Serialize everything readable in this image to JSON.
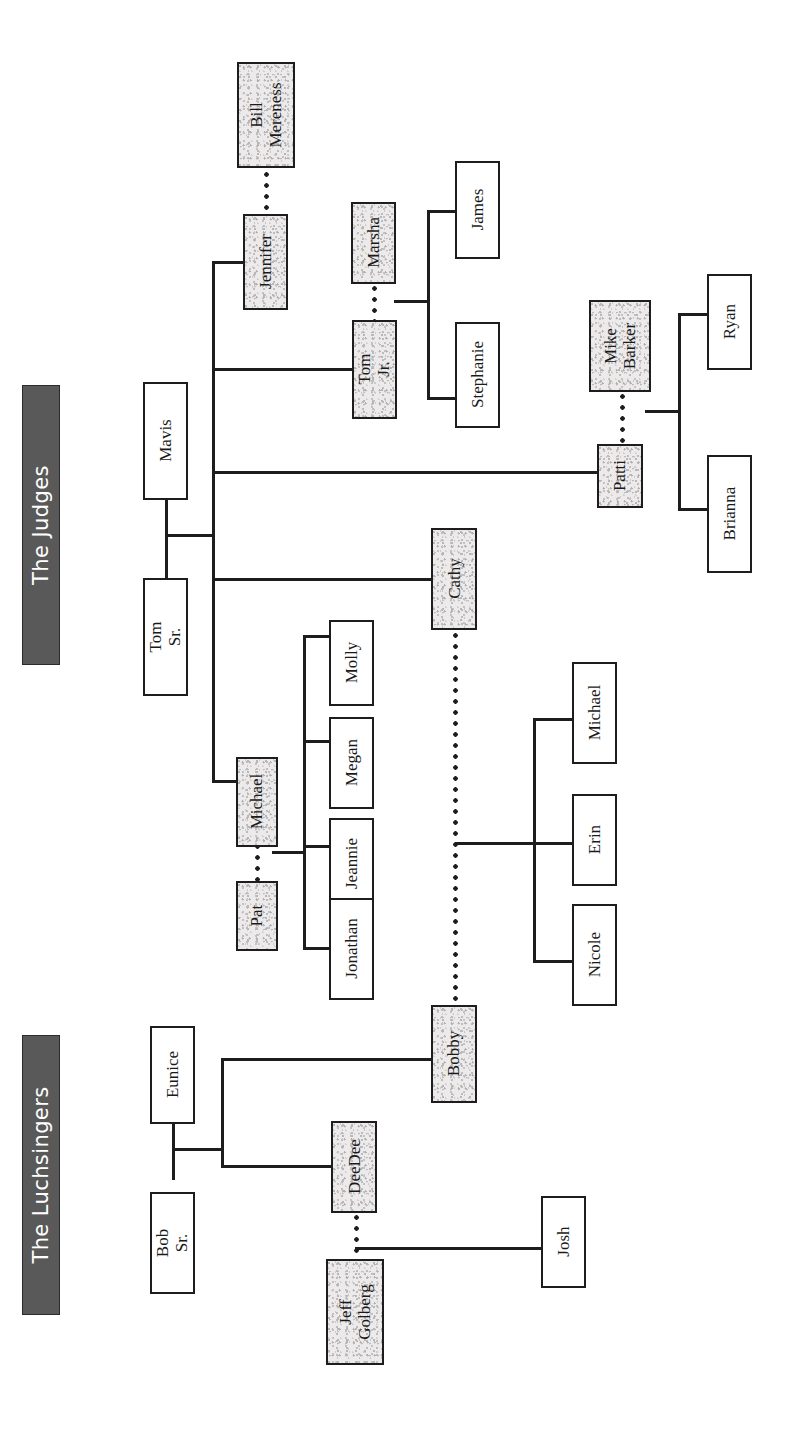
{
  "diagram": {
    "type": "family-tree",
    "width": 793,
    "height": 1439,
    "colors": {
      "banner_fill": "#595959",
      "banner_text": "#ffffff",
      "line": "#1d1d1d",
      "box_border": "#1d1d1d",
      "box_plain_fill": "#ffffff",
      "box_shaded_fill": "#eceaea"
    }
  },
  "banners": [
    {
      "id": "judges",
      "label": "The Judges"
    },
    {
      "id": "luchsingers",
      "label": "The Luchsingers"
    }
  ],
  "people": [
    {
      "id": "bill_mereness",
      "label": "Bill\nMereness",
      "style": "shaded"
    },
    {
      "id": "jennifer",
      "label": "Jennifer",
      "style": "shaded"
    },
    {
      "id": "marsha",
      "label": "Marsha",
      "style": "shaded"
    },
    {
      "id": "james",
      "label": "James",
      "style": "plain"
    },
    {
      "id": "tom_jr",
      "label": "Tom Jr.",
      "style": "shaded"
    },
    {
      "id": "stephanie",
      "label": "Stephanie",
      "style": "plain"
    },
    {
      "id": "mavis",
      "label": "Mavis",
      "style": "plain"
    },
    {
      "id": "tom_sr",
      "label": "Tom Sr.",
      "style": "plain"
    },
    {
      "id": "mike_barker",
      "label": "Mike\nBarker",
      "style": "shaded"
    },
    {
      "id": "patti",
      "label": "Patti",
      "style": "shaded"
    },
    {
      "id": "ryan",
      "label": "Ryan",
      "style": "plain"
    },
    {
      "id": "brianna",
      "label": "Brianna",
      "style": "plain"
    },
    {
      "id": "cathy",
      "label": "Cathy",
      "style": "shaded"
    },
    {
      "id": "molly",
      "label": "Molly",
      "style": "plain"
    },
    {
      "id": "megan",
      "label": "Megan",
      "style": "plain"
    },
    {
      "id": "michael_p",
      "label": "Michael",
      "style": "shaded"
    },
    {
      "id": "jeannie",
      "label": "Jeannie",
      "style": "plain"
    },
    {
      "id": "pat",
      "label": "Pat",
      "style": "shaded"
    },
    {
      "id": "jonathan",
      "label": "Jonathan",
      "style": "plain"
    },
    {
      "id": "michael_c",
      "label": "Michael",
      "style": "plain"
    },
    {
      "id": "erin",
      "label": "Erin",
      "style": "plain"
    },
    {
      "id": "nicole",
      "label": "Nicole",
      "style": "plain"
    },
    {
      "id": "bobby",
      "label": "Bobby",
      "style": "shaded"
    },
    {
      "id": "eunice",
      "label": "Eunice",
      "style": "plain"
    },
    {
      "id": "bob_sr",
      "label": "Bob Sr.",
      "style": "plain"
    },
    {
      "id": "deedee",
      "label": "DeeDee",
      "style": "shaded"
    },
    {
      "id": "josh",
      "label": "Josh",
      "style": "plain"
    },
    {
      "id": "jeff_golberg",
      "label": "Jeff\nGolberg",
      "style": "shaded"
    }
  ],
  "couples": [
    {
      "partners": [
        "bill_mereness",
        "jennifer"
      ],
      "connector": "dotted"
    },
    {
      "partners": [
        "marsha",
        "tom_jr"
      ],
      "connector": "dotted"
    },
    {
      "partners": [
        "mike_barker",
        "patti"
      ],
      "connector": "dotted"
    },
    {
      "partners": [
        "michael_p",
        "pat"
      ],
      "connector": "dotted"
    },
    {
      "partners": [
        "cathy",
        "bobby"
      ],
      "connector": "dotted"
    },
    {
      "partners": [
        "mavis",
        "tom_sr"
      ],
      "connector": "solid"
    },
    {
      "partners": [
        "eunice",
        "bob_sr"
      ],
      "connector": "solid"
    },
    {
      "partners": [
        "deedee",
        "jeff_golberg"
      ],
      "connector": "dotted"
    }
  ],
  "families": [
    {
      "parents": [
        "mavis",
        "tom_sr"
      ],
      "children": [
        "jennifer",
        "tom_jr",
        "patti",
        "cathy",
        "michael_p"
      ]
    },
    {
      "parents": [
        "marsha",
        "tom_jr"
      ],
      "children": [
        "james",
        "stephanie"
      ]
    },
    {
      "parents": [
        "mike_barker",
        "patti"
      ],
      "children": [
        "ryan",
        "brianna"
      ]
    },
    {
      "parents": [
        "michael_p",
        "pat"
      ],
      "children": [
        "molly",
        "megan",
        "jeannie",
        "jonathan"
      ]
    },
    {
      "parents": [
        "cathy",
        "bobby"
      ],
      "children": [
        "michael_c",
        "erin",
        "nicole"
      ]
    },
    {
      "parents": [
        "eunice",
        "bob_sr"
      ],
      "children": [
        "bobby",
        "deedee"
      ]
    },
    {
      "parents": [
        "deedee",
        "jeff_golberg"
      ],
      "children": [
        "josh"
      ]
    }
  ]
}
